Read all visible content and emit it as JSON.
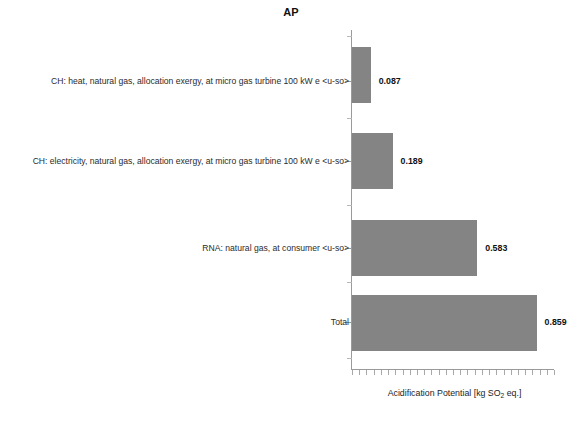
{
  "chart_data": {
    "type": "bar",
    "orientation": "horizontal",
    "title": "AP",
    "xlabel_parts": {
      "before": "Acidification Potential [kg SO",
      "sub": "2",
      "after": " eq.]"
    },
    "xlabel": "Acidification Potential [kg SO2 eq.]",
    "ylabel": "",
    "categories": [
      "CH: heat, natural gas, allocation exergy, at micro gas turbine 100 kW e <u-so>",
      "CH: electricity, natural gas, allocation exergy, at micro gas turbine 100 kW e <u-so>",
      "RNA: natural gas, at consumer <u-so>",
      "Total"
    ],
    "values": [
      0.087,
      0.189,
      0.583,
      0.859
    ],
    "value_labels": [
      "0.087",
      "0.189",
      "0.583",
      "0.859"
    ],
    "xlim": [
      0,
      0.94
    ],
    "grid": false,
    "legend": null,
    "bar_color": "#848484",
    "axis_color": "#9a9a9a",
    "text_color": "#1a1a1a",
    "x_tick_labels": [],
    "x_minor_tick_count": 28
  }
}
